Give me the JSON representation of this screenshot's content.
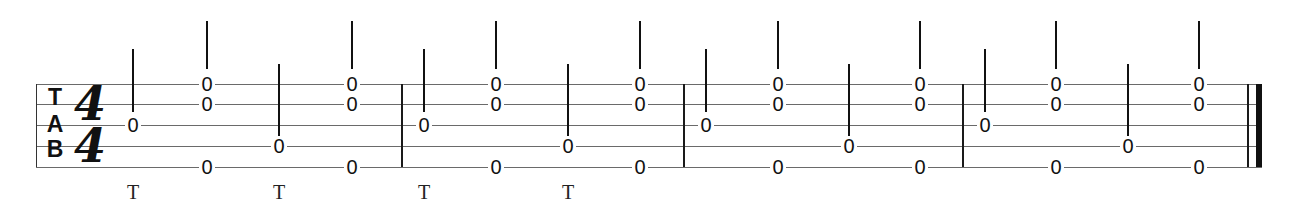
{
  "tablature": {
    "clef": {
      "letters": [
        "T",
        "A",
        "B"
      ]
    },
    "time_signature": {
      "top": "4",
      "bottom": "4"
    },
    "strings": 5,
    "string_y": [
      84,
      104,
      125,
      146,
      167
    ],
    "pick_label": "T",
    "measures": [
      {
        "index": 1,
        "beats": [
          {
            "x": 133,
            "notes": [
              {
                "string": 3,
                "fret": "0"
              }
            ],
            "stem": "short",
            "pick": "T"
          },
          {
            "x": 207,
            "notes": [
              {
                "string": 1,
                "fret": "0"
              },
              {
                "string": 2,
                "fret": "0"
              },
              {
                "string": 5,
                "fret": "0"
              }
            ],
            "stem": "tall",
            "pick": ""
          },
          {
            "x": 279,
            "notes": [
              {
                "string": 4,
                "fret": "0"
              }
            ],
            "stem": "short",
            "pick": "T"
          },
          {
            "x": 352,
            "notes": [
              {
                "string": 1,
                "fret": "0"
              },
              {
                "string": 2,
                "fret": "0"
              },
              {
                "string": 5,
                "fret": "0"
              }
            ],
            "stem": "tall",
            "pick": ""
          }
        ]
      },
      {
        "index": 2,
        "beats": [
          {
            "x": 424,
            "notes": [
              {
                "string": 3,
                "fret": "0"
              }
            ],
            "stem": "short",
            "pick": "T"
          },
          {
            "x": 496,
            "notes": [
              {
                "string": 1,
                "fret": "0"
              },
              {
                "string": 2,
                "fret": "0"
              },
              {
                "string": 5,
                "fret": "0"
              }
            ],
            "stem": "tall",
            "pick": ""
          },
          {
            "x": 568,
            "notes": [
              {
                "string": 4,
                "fret": "0"
              }
            ],
            "stem": "short",
            "pick": "T"
          },
          {
            "x": 640,
            "notes": [
              {
                "string": 1,
                "fret": "0"
              },
              {
                "string": 2,
                "fret": "0"
              },
              {
                "string": 5,
                "fret": "0"
              }
            ],
            "stem": "tall",
            "pick": ""
          }
        ]
      },
      {
        "index": 3,
        "beats": [
          {
            "x": 706,
            "notes": [
              {
                "string": 3,
                "fret": "0"
              }
            ],
            "stem": "short",
            "pick": ""
          },
          {
            "x": 778,
            "notes": [
              {
                "string": 1,
                "fret": "0"
              },
              {
                "string": 2,
                "fret": "0"
              },
              {
                "string": 5,
                "fret": "0"
              }
            ],
            "stem": "tall",
            "pick": ""
          },
          {
            "x": 849,
            "notes": [
              {
                "string": 4,
                "fret": "0"
              }
            ],
            "stem": "short",
            "pick": ""
          },
          {
            "x": 920,
            "notes": [
              {
                "string": 1,
                "fret": "0"
              },
              {
                "string": 2,
                "fret": "0"
              },
              {
                "string": 5,
                "fret": "0"
              }
            ],
            "stem": "tall",
            "pick": ""
          }
        ]
      },
      {
        "index": 4,
        "beats": [
          {
            "x": 985,
            "notes": [
              {
                "string": 3,
                "fret": "0"
              }
            ],
            "stem": "short",
            "pick": ""
          },
          {
            "x": 1056,
            "notes": [
              {
                "string": 1,
                "fret": "0"
              },
              {
                "string": 2,
                "fret": "0"
              },
              {
                "string": 5,
                "fret": "0"
              }
            ],
            "stem": "tall",
            "pick": ""
          },
          {
            "x": 1128,
            "notes": [
              {
                "string": 4,
                "fret": "0"
              }
            ],
            "stem": "short",
            "pick": ""
          },
          {
            "x": 1199,
            "notes": [
              {
                "string": 1,
                "fret": "0"
              },
              {
                "string": 2,
                "fret": "0"
              },
              {
                "string": 5,
                "fret": "0"
              }
            ],
            "stem": "tall",
            "pick": ""
          }
        ]
      }
    ],
    "barlines_x": [
      36,
      401,
      683,
      962
    ],
    "final_barline": {
      "thin_x": 1247,
      "thick_x": 1256
    }
  }
}
